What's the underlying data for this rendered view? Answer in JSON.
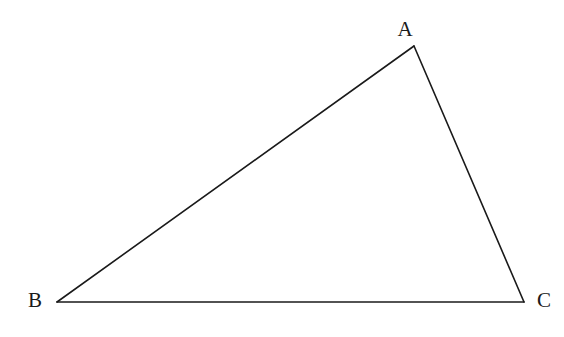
{
  "diagram": {
    "type": "triangle",
    "stroke_color": "#1a1a1a",
    "background": "#ffffff",
    "vertices": [
      {
        "name": "A",
        "label": "A",
        "x": 414,
        "y": 46,
        "label_x": 405,
        "label_y": 36
      },
      {
        "name": "B",
        "label": "B",
        "x": 57,
        "y": 302,
        "label_x": 35,
        "label_y": 307
      },
      {
        "name": "C",
        "label": "C",
        "x": 524,
        "y": 302,
        "label_x": 544,
        "label_y": 307
      }
    ],
    "edges": [
      {
        "name": "AB",
        "from": "A",
        "to": "B"
      },
      {
        "name": "BC",
        "from": "B",
        "to": "C"
      },
      {
        "name": "CA",
        "from": "C",
        "to": "A"
      }
    ]
  }
}
